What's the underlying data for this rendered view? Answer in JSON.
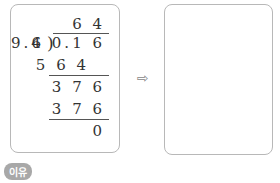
{
  "division": {
    "quotient": "6 4",
    "divisor": "9.4",
    "dividend": "6 0.1 6",
    "step1_product": "5 6 4",
    "step1_remainder": "3 7 6",
    "step2_product": "3 7 6",
    "final_remainder": "0"
  },
  "arrow_icon": "⇨",
  "answer_box": "",
  "reason_label": "이유"
}
